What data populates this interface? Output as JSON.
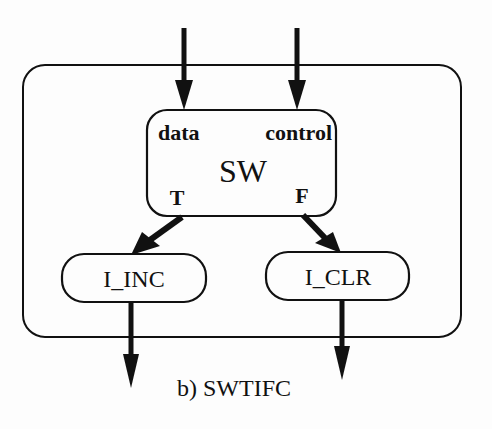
{
  "diagram": {
    "caption": "b) SWTIFC",
    "switch_node": {
      "title": "SW",
      "input_labels": {
        "data": "data",
        "control": "control"
      },
      "output_labels": {
        "true": "T",
        "false": "F"
      }
    },
    "nodes": [
      {
        "id": "i_inc",
        "label": "I_INC"
      },
      {
        "id": "i_clr",
        "label": "I_CLR"
      }
    ],
    "edges": [
      {
        "from": "external",
        "to": "SW.data"
      },
      {
        "from": "external",
        "to": "SW.control"
      },
      {
        "from": "SW.T",
        "to": "I_INC"
      },
      {
        "from": "SW.F",
        "to": "I_CLR"
      },
      {
        "from": "I_INC",
        "to": "external"
      },
      {
        "from": "I_CLR",
        "to": "external"
      }
    ],
    "colors": {
      "stroke": "#111111",
      "background": "#fdfdfd"
    }
  }
}
